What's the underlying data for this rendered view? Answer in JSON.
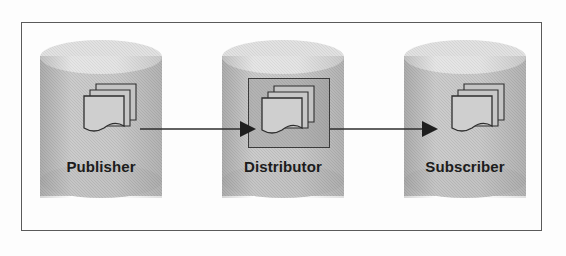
{
  "diagram": {
    "type": "flow-diagram",
    "frame": {
      "border_color": "#5a5a5a",
      "background": "#fdfdfd"
    },
    "palette": {
      "cylinder_body": "#b2b2b2",
      "cylinder_top": "#d4d4d4",
      "cylinder_bottom": "#ababab",
      "document_fill": "#c9c9c9",
      "outline": "#2e2e2e",
      "label_text": "#1c1c1c"
    },
    "nodes": [
      {
        "id": "publisher",
        "label": "Publisher",
        "shape": "cylinder",
        "icon": "document-stack-icon",
        "highlighted": false
      },
      {
        "id": "distributor",
        "label": "Distributor",
        "shape": "cylinder",
        "icon": "document-stack-icon",
        "highlighted": true
      },
      {
        "id": "subscriber",
        "label": "Subscriber",
        "shape": "cylinder",
        "icon": "document-stack-icon",
        "highlighted": false
      }
    ],
    "connectors": [
      {
        "id": "publisher-to-distributor",
        "from": "publisher",
        "to": "distributor",
        "style": "solid-arrow",
        "label": ""
      },
      {
        "id": "distributor-to-subscriber",
        "from": "distributor",
        "to": "subscriber",
        "style": "solid-arrow",
        "label": ""
      }
    ]
  }
}
